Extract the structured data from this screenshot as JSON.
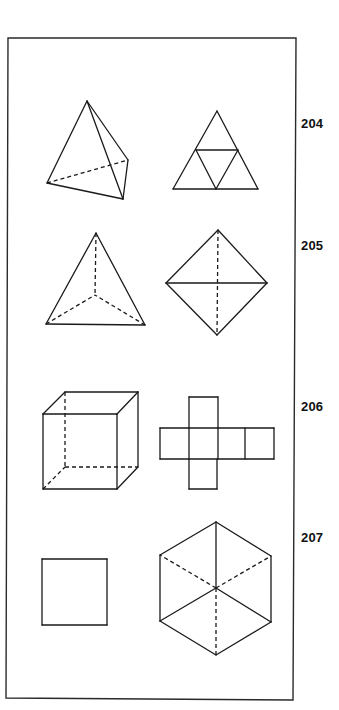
{
  "figure": {
    "frame": {
      "points": [
        [
          8,
          38
        ],
        [
          296,
          38
        ],
        [
          293,
          700
        ],
        [
          6,
          698
        ]
      ]
    },
    "rows": [
      {
        "label": "204",
        "label_pos": [
          301,
          117
        ],
        "shapes": [
          {
            "name": "tetrahedron-oblique",
            "solid": [
              [
                [
                  87,
                  101
                ],
                [
                  47,
                  183
                ]
              ],
              [
                [
                  87,
                  101
                ],
                [
                  128,
                  160
                ]
              ],
              [
                [
                  87,
                  101
                ],
                [
                  123,
                  199
                ]
              ],
              [
                [
                  47,
                  183
                ],
                [
                  123,
                  199
                ]
              ],
              [
                [
                  128,
                  160
                ],
                [
                  123,
                  199
                ]
              ]
            ],
            "dashed": [
              [
                [
                  47,
                  183
                ],
                [
                  128,
                  160
                ]
              ]
            ]
          },
          {
            "name": "tetrahedron-net",
            "solid": [
              [
                [
                  217,
                  111
                ],
                [
                  173,
                  189
                ]
              ],
              [
                [
                  217,
                  111
                ],
                [
                  258,
                  189
                ]
              ],
              [
                [
                  173,
                  189
                ],
                [
                  258,
                  189
                ]
              ],
              [
                [
                  196,
                  150
                ],
                [
                  238,
                  150
                ]
              ],
              [
                [
                  196,
                  150
                ],
                [
                  216,
                  189
                ]
              ],
              [
                [
                  238,
                  150
                ],
                [
                  216,
                  189
                ]
              ]
            ],
            "dashed": []
          }
        ]
      },
      {
        "label": "205",
        "label_pos": [
          301,
          239
        ],
        "shapes": [
          {
            "name": "tetrahedron-top-view",
            "solid": [
              [
                [
                  96,
                  233
                ],
                [
                  46,
                  324
                ]
              ],
              [
                [
                  96,
                  233
                ],
                [
                  145,
                  325
                ]
              ],
              [
                [
                  46,
                  324
                ],
                [
                  145,
                  325
                ]
              ]
            ],
            "dashed": [
              [
                [
                  96,
                  233
                ],
                [
                  95,
                  295
                ]
              ],
              [
                [
                  46,
                  324
                ],
                [
                  95,
                  295
                ]
              ],
              [
                [
                  145,
                  325
                ],
                [
                  95,
                  295
                ]
              ]
            ]
          },
          {
            "name": "octahedron",
            "solid": [
              [
                [
                  218,
                  230
                ],
                [
                  166,
                  283
                ]
              ],
              [
                [
                  218,
                  230
                ],
                [
                  267,
                  283
                ]
              ],
              [
                [
                  166,
                  283
                ],
                [
                  217,
                  335
                ]
              ],
              [
                [
                  267,
                  283
                ],
                [
                  217,
                  335
                ]
              ],
              [
                [
                  166,
                  283
                ],
                [
                  267,
                  283
                ]
              ]
            ],
            "dashed": [
              [
                [
                  218,
                  230
                ],
                [
                  217,
                  335
                ]
              ]
            ]
          }
        ]
      },
      {
        "label": "206",
        "label_pos": [
          301,
          400
        ],
        "shapes": [
          {
            "name": "cube",
            "solid": [
              [
                [
                  43,
                  414
                ],
                [
                  117,
                  414
                ]
              ],
              [
                [
                  117,
                  414
                ],
                [
                  117,
                  489
                ]
              ],
              [
                [
                  117,
                  489
                ],
                [
                  43,
                  489
                ]
              ],
              [
                [
                  43,
                  489
                ],
                [
                  43,
                  414
                ]
              ],
              [
                [
                  65,
                  392
                ],
                [
                  138,
                  392
                ]
              ],
              [
                [
                  138,
                  392
                ],
                [
                  138,
                  467
                ]
              ],
              [
                [
                  43,
                  414
                ],
                [
                  65,
                  392
                ]
              ],
              [
                [
                  117,
                  414
                ],
                [
                  138,
                  392
                ]
              ],
              [
                [
                  117,
                  489
                ],
                [
                  138,
                  467
                ]
              ]
            ],
            "dashed": [
              [
                [
                  65,
                  392
                ],
                [
                  65,
                  467
                ]
              ],
              [
                [
                  65,
                  467
                ],
                [
                  138,
                  467
                ]
              ],
              [
                [
                  43,
                  489
                ],
                [
                  65,
                  467
                ]
              ]
            ]
          },
          {
            "name": "cube-net",
            "solid": [
              [
                [
                  189,
                  397
                ],
                [
                  218,
                  397
                ]
              ],
              [
                [
                  189,
                  397
                ],
                [
                  189,
                  428
                ]
              ],
              [
                [
                  218,
                  397
                ],
                [
                  218,
                  428
                ]
              ],
              [
                [
                  160,
                  428
                ],
                [
                  274,
                  428
                ]
              ],
              [
                [
                  160,
                  459
                ],
                [
                  274,
                  459
                ]
              ],
              [
                [
                  160,
                  428
                ],
                [
                  160,
                  459
                ]
              ],
              [
                [
                  189,
                  428
                ],
                [
                  189,
                  459
                ]
              ],
              [
                [
                  218,
                  428
                ],
                [
                  218,
                  459
                ]
              ],
              [
                [
                  245,
                  428
                ],
                [
                  245,
                  459
                ]
              ],
              [
                [
                  274,
                  428
                ],
                [
                  274,
                  459
                ]
              ],
              [
                [
                  189,
                  459
                ],
                [
                  189,
                  489
                ]
              ],
              [
                [
                  217,
                  459
                ],
                [
                  217,
                  489
                ]
              ],
              [
                [
                  189,
                  489
                ],
                [
                  217,
                  489
                ]
              ]
            ],
            "dashed": []
          }
        ]
      },
      {
        "label": "207",
        "label_pos": [
          301,
          531
        ],
        "shapes": [
          {
            "name": "cube-face-view-square",
            "solid": [
              [
                [
                  42,
                  559
                ],
                [
                  107,
                  559
                ]
              ],
              [
                [
                  107,
                  559
                ],
                [
                  107,
                  625
                ]
              ],
              [
                [
                  107,
                  625
                ],
                [
                  42,
                  625
                ]
              ],
              [
                [
                  42,
                  625
                ],
                [
                  42,
                  559
                ]
              ]
            ],
            "dashed": []
          },
          {
            "name": "cube-vertex-view-hexagon",
            "solid": [
              [
                [
                  216,
                  522
                ],
                [
                  271,
                  556
                ]
              ],
              [
                [
                  271,
                  556
                ],
                [
                  271,
                  622
                ]
              ],
              [
                [
                  271,
                  622
                ],
                [
                  216,
                  655
                ]
              ],
              [
                [
                  216,
                  655
                ],
                [
                  160,
                  621
                ]
              ],
              [
                [
                  160,
                  621
                ],
                [
                  160,
                  555
                ]
              ],
              [
                [
                  160,
                  555
                ],
                [
                  216,
                  522
                ]
              ],
              [
                [
                  216,
                  588
                ],
                [
                  216,
                  522
                ]
              ],
              [
                [
                  216,
                  588
                ],
                [
                  160,
                  621
                ]
              ],
              [
                [
                  216,
                  588
                ],
                [
                  271,
                  622
                ]
              ]
            ],
            "dashed": [
              [
                [
                  216,
                  588
                ],
                [
                  160,
                  555
                ]
              ],
              [
                [
                  216,
                  588
                ],
                [
                  271,
                  556
                ]
              ],
              [
                [
                  216,
                  588
                ],
                [
                  216,
                  655
                ]
              ]
            ]
          }
        ]
      }
    ]
  },
  "colors": {
    "line": "#1a1a1a",
    "frame": "#2a2a2a",
    "background": "#ffffff",
    "label": "#111111"
  }
}
